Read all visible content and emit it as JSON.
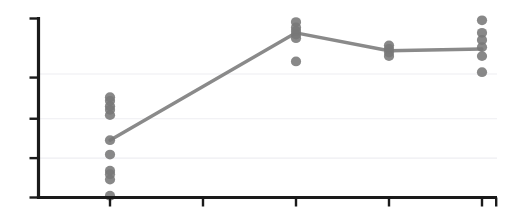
{
  "chart": {
    "title": "",
    "subtitle": "",
    "background_color": "#ffffff",
    "axis_color": "#1a1a1a",
    "gridline_color": "#eeeef2",
    "series_color": "#8a8a8a",
    "dot_color": "#787878"
  },
  "chart_data": {
    "type": "scatter",
    "title": "",
    "subtitle": "",
    "xlabel": "",
    "ylabel": "",
    "xlim": [
      0,
      5
    ],
    "ylim": [
      0,
      1
    ],
    "grid": true,
    "legend": "none",
    "x_tick_labels": [
      "",
      "",
      "",
      "",
      ""
    ],
    "y_tick_labels": [
      "",
      "",
      "",
      "",
      ""
    ],
    "x_tick_values": [
      1,
      2,
      3,
      4,
      5
    ],
    "y_tick_values": [
      0.0,
      0.22,
      0.44,
      0.67,
      1.0
    ],
    "gridline_values": [
      0.22,
      0.44,
      0.69
    ],
    "categories": [
      "1",
      "2",
      "3",
      "4",
      "5"
    ],
    "series": [
      {
        "name": "mean",
        "type": "line",
        "x": [
          1,
          3,
          4,
          5
        ],
        "values": [
          0.32,
          0.92,
          0.82,
          0.83
        ]
      },
      {
        "name": "observations",
        "type": "scatter",
        "points": [
          {
            "x": 1,
            "y": 0.56
          },
          {
            "x": 1,
            "y": 0.54
          },
          {
            "x": 1,
            "y": 0.51
          },
          {
            "x": 1,
            "y": 0.49
          },
          {
            "x": 1,
            "y": 0.46
          },
          {
            "x": 1,
            "y": 0.32
          },
          {
            "x": 1,
            "y": 0.24
          },
          {
            "x": 1,
            "y": 0.15
          },
          {
            "x": 1,
            "y": 0.13
          },
          {
            "x": 1,
            "y": 0.1
          },
          {
            "x": 1,
            "y": 0.01
          },
          {
            "x": 3,
            "y": 0.98
          },
          {
            "x": 3,
            "y": 0.95
          },
          {
            "x": 3,
            "y": 0.93
          },
          {
            "x": 3,
            "y": 0.91
          },
          {
            "x": 3,
            "y": 0.89
          },
          {
            "x": 3,
            "y": 0.76
          },
          {
            "x": 4,
            "y": 0.85
          },
          {
            "x": 4,
            "y": 0.83
          },
          {
            "x": 4,
            "y": 0.81
          },
          {
            "x": 4,
            "y": 0.79
          },
          {
            "x": 5,
            "y": 0.99
          },
          {
            "x": 5,
            "y": 0.92
          },
          {
            "x": 5,
            "y": 0.88
          },
          {
            "x": 5,
            "y": 0.84
          },
          {
            "x": 5,
            "y": 0.79
          },
          {
            "x": 5,
            "y": 0.7
          }
        ]
      }
    ]
  }
}
